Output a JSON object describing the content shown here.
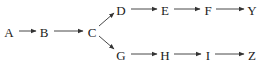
{
  "diagram": {
    "type": "flow",
    "nodes": [
      {
        "id": "A",
        "label": "A",
        "x": 9,
        "y": 32
      },
      {
        "id": "B",
        "label": "B",
        "x": 44,
        "y": 32
      },
      {
        "id": "C",
        "label": "C",
        "x": 92,
        "y": 32
      },
      {
        "id": "D",
        "label": "D",
        "x": 121,
        "y": 10
      },
      {
        "id": "E",
        "label": "E",
        "x": 165,
        "y": 10
      },
      {
        "id": "F",
        "label": "F",
        "x": 208,
        "y": 10
      },
      {
        "id": "Y",
        "label": "Y",
        "x": 252,
        "y": 10
      },
      {
        "id": "G",
        "label": "G",
        "x": 121,
        "y": 55
      },
      {
        "id": "H",
        "label": "H",
        "x": 165,
        "y": 55
      },
      {
        "id": "I",
        "label": "I",
        "x": 208,
        "y": 55
      },
      {
        "id": "Z",
        "label": "Z",
        "x": 252,
        "y": 55
      }
    ],
    "edges": [
      {
        "from": "A",
        "to": "B",
        "x1": 19,
        "y1": 31,
        "x2": 36,
        "y2": 31
      },
      {
        "from": "B",
        "to": "C",
        "x1": 54,
        "y1": 31,
        "x2": 83,
        "y2": 31
      },
      {
        "from": "C",
        "to": "D",
        "x1": 99,
        "y1": 26,
        "x2": 114,
        "y2": 13
      },
      {
        "from": "C",
        "to": "G",
        "x1": 99,
        "y1": 36,
        "x2": 114,
        "y2": 49
      },
      {
        "from": "D",
        "to": "E",
        "x1": 131,
        "y1": 9,
        "x2": 157,
        "y2": 9
      },
      {
        "from": "E",
        "to": "F",
        "x1": 174,
        "y1": 9,
        "x2": 200,
        "y2": 9
      },
      {
        "from": "F",
        "to": "Y",
        "x1": 216,
        "y1": 9,
        "x2": 244,
        "y2": 9
      },
      {
        "from": "G",
        "to": "H",
        "x1": 131,
        "y1": 54,
        "x2": 157,
        "y2": 54
      },
      {
        "from": "H",
        "to": "I",
        "x1": 174,
        "y1": 54,
        "x2": 201,
        "y2": 54
      },
      {
        "from": "I",
        "to": "Z",
        "x1": 215,
        "y1": 54,
        "x2": 244,
        "y2": 54
      }
    ]
  }
}
